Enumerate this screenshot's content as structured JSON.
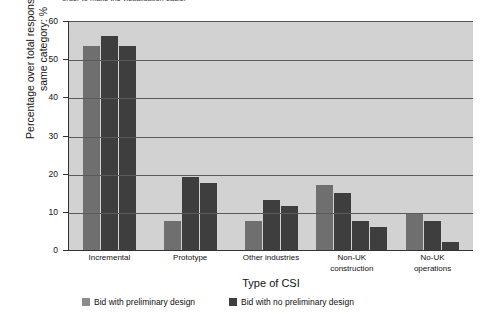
{
  "top_caption": "order to make the visualisation easier",
  "chart_data": {
    "type": "bar",
    "title": "",
    "xlabel": "Type of CSI",
    "ylabel": "Percentage over total responses in the same category: %",
    "ylim": [
      0,
      60
    ],
    "yticks": [
      0,
      10,
      20,
      30,
      40,
      50,
      60
    ],
    "grid": true,
    "legend_position": "bottom",
    "categories": [
      "Incremental",
      "Prototype",
      "Other industries",
      "Non-UK\nconstruction",
      "No-UK\noperations"
    ],
    "category_lines": [
      [
        "Incremental"
      ],
      [
        "Prototype"
      ],
      [
        "Other industries"
      ],
      [
        "Non-UK",
        "construction"
      ],
      [
        "No-UK",
        "operations"
      ]
    ],
    "series": [
      {
        "name": "Bid with preliminary design",
        "color": "#6f6f6f",
        "values": [
          53.5,
          7.5,
          7.5,
          17,
          9.5
        ]
      },
      {
        "name": "Bid with no preliminary design",
        "color": "#3e3e3e",
        "values": [
          56,
          19,
          13,
          15,
          7.5
        ]
      },
      {
        "name": "Bid with no preliminary design",
        "color": "#3e3e3e",
        "values": [
          53.5,
          17.5,
          11.5,
          7.5,
          2
        ]
      },
      {
        "name": "Bid with no preliminary design",
        "color": "#3e3e3e",
        "values": [
          0,
          0,
          0,
          6,
          0
        ]
      }
    ],
    "legend": [
      {
        "label": "Bid with preliminary design",
        "color": "#8c8c8c"
      },
      {
        "label": "Bid with no preliminary design",
        "color": "#3e3e3e"
      }
    ]
  }
}
